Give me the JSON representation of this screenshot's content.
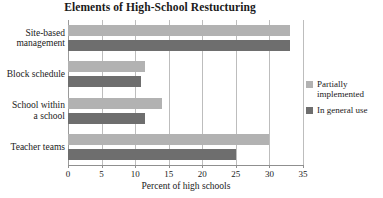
{
  "chart_data": {
    "type": "bar",
    "orientation": "horizontal",
    "title": "Elements of High-School Restucturing",
    "xlabel": "Percent of high schools",
    "ylabel": "",
    "xlim": [
      0,
      35
    ],
    "xticks": [
      0,
      5,
      10,
      15,
      20,
      25,
      30,
      35
    ],
    "xtick_labels": [
      "0",
      "5",
      "10",
      "15",
      "20",
      "25",
      "30",
      "35"
    ],
    "grid": "vertical",
    "legend_position": "right",
    "categories": [
      "Site-based management",
      "Block schedule",
      "School within a school",
      "Teacher teams"
    ],
    "category_label_lines": [
      [
        "Site-based",
        "management"
      ],
      [
        "Block schedule"
      ],
      [
        "School within",
        "a school"
      ],
      [
        "Teacher teams"
      ]
    ],
    "series": [
      {
        "name": "Partially implemented",
        "name_lines": [
          "Partially",
          "implemented"
        ],
        "color": "#b2b2b2",
        "values": [
          33.1,
          11.4,
          14.0,
          30.0
        ]
      },
      {
        "name": "In general use",
        "name_lines": [
          "In general use"
        ],
        "color": "#6e6e6e",
        "values": [
          33.1,
          10.8,
          11.5,
          25.0
        ]
      }
    ]
  },
  "colors": {
    "background": "#ffffff",
    "text": "#1a1a1a",
    "gridline": "#bdbdbd",
    "axis": "#8f8f8f",
    "series_partially_implemented": "#b2b2b2",
    "series_in_general_use": "#6e6e6e"
  }
}
